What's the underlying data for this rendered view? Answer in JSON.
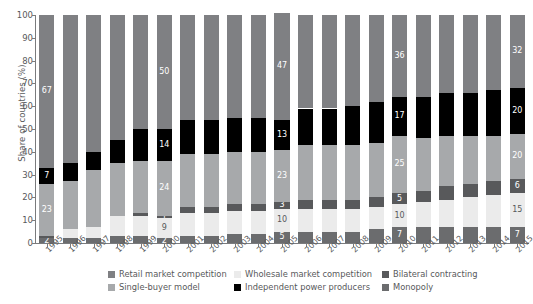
{
  "chart_data": {
    "type": "bar",
    "stacked": true,
    "title": "",
    "xlabel": "",
    "ylabel": "Share of countries (%)",
    "ylim": [
      0,
      100
    ],
    "yticks": [
      0,
      10,
      20,
      30,
      40,
      50,
      60,
      70,
      80,
      90,
      100
    ],
    "grid": false,
    "legend_position": "bottom",
    "categories": [
      "1995",
      "1996",
      "1997",
      "1998",
      "1999",
      "2000",
      "2001",
      "2002",
      "2003",
      "2004",
      "2005",
      "2006",
      "2007",
      "2008",
      "2009",
      "2010",
      "2011",
      "2012",
      "2013",
      "2014",
      "2015"
    ],
    "stack_order_bottom_to_top": [
      "Monopoly",
      "Wholesale market competition",
      "Bilateral contracting",
      "Single-buyer model",
      "Independent power producers",
      "Retail market competition"
    ],
    "series": [
      {
        "name": "Monopoly",
        "color": "#6b6c6e",
        "values": [
          2,
          2,
          2,
          3,
          3,
          2,
          3,
          3,
          4,
          4,
          5,
          5,
          5,
          5,
          6,
          7,
          7,
          7,
          7,
          7,
          7
        ]
      },
      {
        "name": "Wholesale market competition",
        "color": "#ebebeb",
        "values": [
          0,
          4,
          5,
          9,
          9,
          9,
          10,
          10,
          10,
          10,
          10,
          10,
          10,
          10,
          10,
          10,
          11,
          12,
          13,
          14,
          15
        ]
      },
      {
        "name": "Bilateral contracting",
        "color": "#58595b",
        "values": [
          1,
          0,
          0,
          0,
          1,
          1,
          3,
          3,
          3,
          3,
          3,
          4,
          4,
          4,
          4,
          5,
          5,
          6,
          6,
          6,
          6
        ]
      },
      {
        "name": "Single-buyer model",
        "color": "#a7a9ab",
        "values": [
          23,
          21,
          25,
          23,
          23,
          24,
          23,
          23,
          23,
          23,
          23,
          24,
          24,
          24,
          24,
          25,
          23,
          22,
          21,
          20,
          20
        ]
      },
      {
        "name": "Independent power producers",
        "color": "#000000",
        "values": [
          7,
          8,
          8,
          10,
          14,
          14,
          15,
          15,
          15,
          15,
          13,
          16,
          16,
          17,
          18,
          17,
          18,
          19,
          19,
          20,
          20
        ]
      },
      {
        "name": "Retail market competition",
        "color": "#7f8083",
        "values": [
          67,
          65,
          60,
          55,
          50,
          50,
          46,
          46,
          45,
          45,
          47,
          41,
          41,
          40,
          38,
          36,
          36,
          34,
          34,
          33,
          32
        ]
      }
    ],
    "value_labels": {
      "1995": {
        "Monopoly": "2",
        "Single-buyer model": "23",
        "Independent power producers": "7",
        "Retail market competition": "67"
      },
      "2000": {
        "Monopoly": "2",
        "Wholesale market competition": "9",
        "Bilateral contracting": "1",
        "Single-buyer model": "24",
        "Independent power producers": "14",
        "Retail market competition": "50"
      },
      "2005": {
        "Monopoly": "5",
        "Wholesale market competition": "10",
        "Bilateral contracting": "3",
        "Single-buyer model": "23",
        "Independent power producers": "13",
        "Retail market competition": "47"
      },
      "2010": {
        "Monopoly": "7",
        "Wholesale market competition": "10",
        "Bilateral contracting": "5",
        "Single-buyer model": "25",
        "Independent power producers": "17",
        "Retail market competition": "36"
      },
      "2015": {
        "Monopoly": "7",
        "Wholesale market competition": "15",
        "Bilateral contracting": "6",
        "Single-buyer model": "20",
        "Independent power producers": "20",
        "Retail market competition": "32"
      }
    }
  },
  "legend": {
    "rows": [
      [
        {
          "label": "Retail market competition",
          "color": "#7f8083",
          "name": "legend-retail-market-competition"
        },
        {
          "label": "Wholesale market competition",
          "color": "#ebebeb",
          "name": "legend-wholesale-market-competition"
        },
        {
          "label": "Bilateral contracting",
          "color": "#58595b",
          "name": "legend-bilateral-contracting"
        }
      ],
      [
        {
          "label": "Single-buyer model",
          "color": "#a7a9ab",
          "name": "legend-single-buyer-model"
        },
        {
          "label": "Independent power producers",
          "color": "#000000",
          "name": "legend-independent-power-producers"
        },
        {
          "label": "Monopoly",
          "color": "#6b6c6e",
          "name": "legend-monopoly"
        }
      ]
    ]
  }
}
